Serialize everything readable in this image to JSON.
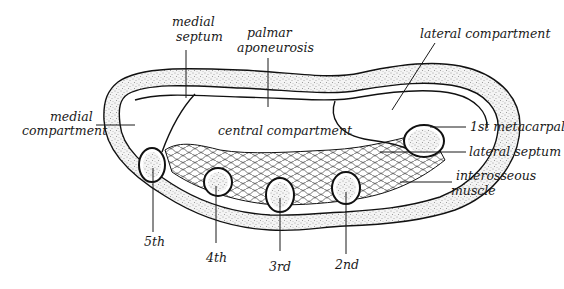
{
  "diagram": {
    "colors": {
      "ink": "#111111",
      "background": "#ffffff",
      "stipple": "#333333"
    },
    "labels": {
      "medial_septum_1": "medial",
      "medial_septum_2": "septum",
      "palmar_aponeurosis_1": "palmar",
      "palmar_aponeurosis_2": "aponeurosis",
      "lateral_compartment": "lateral compartment",
      "medial_compartment_1": "medial",
      "medial_compartment_2": "compartment",
      "central_compartment": "central compartment",
      "first_metacarpal": "1st metacarpal",
      "lateral_septum": "lateral septum",
      "interosseous_muscle_1": "interosseous",
      "interosseous_muscle_2": "muscle",
      "fifth": "5th",
      "fourth": "4th",
      "third": "3rd",
      "second": "2nd"
    }
  }
}
